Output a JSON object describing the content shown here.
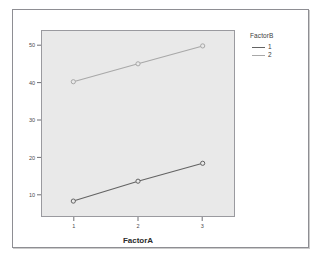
{
  "chart_data": {
    "type": "line",
    "title": "",
    "subtitle": "",
    "xlabel": "FactorA",
    "ylabel": "",
    "x": [
      1,
      2,
      3
    ],
    "xticklabels": [
      "1",
      "2",
      "3"
    ],
    "yticks": [
      10,
      20,
      30,
      40,
      50
    ],
    "yticklabels": [
      "10",
      "20",
      "30",
      "40",
      "50"
    ],
    "ylim": [
      6,
      53
    ],
    "xlim": [
      0.5,
      3.5
    ],
    "grid": false,
    "legend_position": "right",
    "legend_title": "FactorB",
    "series": [
      {
        "name": "1",
        "values": [
          10.0,
          15.0,
          19.5
        ],
        "color": "#636363",
        "marker": "circle"
      },
      {
        "name": "2",
        "values": [
          40.0,
          44.5,
          49.0
        ],
        "color": "#a8a8a8",
        "marker": "circle"
      }
    ],
    "panel_background": "#e9e9e9",
    "panel_border": "#9a9a9f",
    "figure_background": "#ffffff"
  },
  "figure": {
    "frame_border_color": "#8e8e93"
  }
}
